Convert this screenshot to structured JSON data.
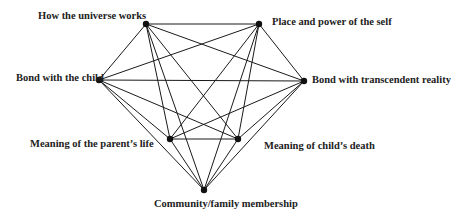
{
  "diagram": {
    "type": "complete-graph",
    "edge_color": "#1a1a1a",
    "node_color": "#111111",
    "nodes": [
      {
        "id": "hu",
        "label": "How the universe works",
        "x": 146,
        "y": 24
      },
      {
        "id": "pp",
        "label": "Place and power of the self",
        "x": 259,
        "y": 24
      },
      {
        "id": "bc",
        "label": "Bond with the child",
        "x": 99,
        "y": 80
      },
      {
        "id": "bt",
        "label": "Bond with transcendent reality",
        "x": 304,
        "y": 81
      },
      {
        "id": "mp",
        "label": "Meaning of the parent’s life",
        "x": 170,
        "y": 139
      },
      {
        "id": "mc",
        "label": "Meaning of child’s death",
        "x": 238,
        "y": 139
      },
      {
        "id": "cf",
        "label": "Community/family membership",
        "x": 204,
        "y": 190
      }
    ]
  }
}
